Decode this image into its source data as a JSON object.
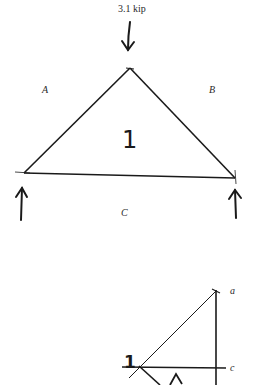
{
  "truss": {
    "load_label": "3.1 kip",
    "space_labels": {
      "A": "A",
      "B": "B",
      "C": "C"
    },
    "panel_label": "1"
  },
  "force_polygon": {
    "point_labels": {
      "a": "a",
      "c": "c"
    },
    "node_label": "1"
  },
  "colors": {
    "line": "#1a1a1a",
    "background": "#ffffff"
  }
}
